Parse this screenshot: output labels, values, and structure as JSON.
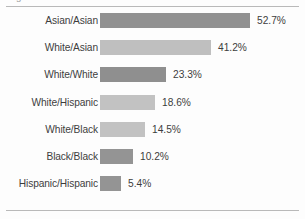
{
  "chart_data": {
    "type": "bar",
    "orientation": "horizontal",
    "title": "",
    "xlabel": "",
    "ylabel": "",
    "grid": false,
    "legend": null,
    "xlim": [
      0,
      60
    ],
    "categories": [
      "Asian/Asian",
      "White/Asian",
      "White/White",
      "White/Hispanic",
      "White/Black",
      "Black/Black",
      "Hispanic/Hispanic"
    ],
    "values": [
      52.7,
      41.2,
      23.3,
      18.6,
      14.5,
      10.2,
      5.4
    ],
    "data_labels": [
      "52.7%",
      "41.2%",
      "23.3%",
      "18.6%",
      "14.5%",
      "10.2%",
      "5.4%"
    ],
    "bar_colors": [
      "#919191",
      "#bfbfbf",
      "#8f8f8f",
      "#c2c2c2",
      "#c2c2c2",
      "#949494",
      "#949494"
    ]
  },
  "colors": {
    "background": "#fdfdfd",
    "rule": "#b9b9b9",
    "text": "#3d3d3d",
    "bar_dark": "#919191",
    "bar_light": "#c2c2c2"
  },
  "rows": [
    {
      "label": "Asian/Asian",
      "value_label": "52.7%",
      "value": 52.7,
      "bar_px": 150,
      "color": "#919191"
    },
    {
      "label": "White/Asian",
      "value_label": "41.2%",
      "value": 41.2,
      "bar_px": 111,
      "color": "#bfbfbf"
    },
    {
      "label": "White/White",
      "value_label": "23.3%",
      "value": 23.3,
      "bar_px": 66,
      "color": "#8f8f8f"
    },
    {
      "label": "White/Hispanic",
      "value_label": "18.6%",
      "value": 18.6,
      "bar_px": 55,
      "color": "#c2c2c2"
    },
    {
      "label": "White/Black",
      "value_label": "14.5%",
      "value": 14.5,
      "bar_px": 45,
      "color": "#c2c2c2"
    },
    {
      "label": "Black/Black",
      "value_label": "10.2%",
      "value": 10.2,
      "bar_px": 33,
      "color": "#949494"
    },
    {
      "label": "Hispanic/Hispanic",
      "value_label": "5.4%",
      "value": 5.4,
      "bar_px": 21,
      "color": "#949494"
    }
  ],
  "title_clipped": "Figure"
}
